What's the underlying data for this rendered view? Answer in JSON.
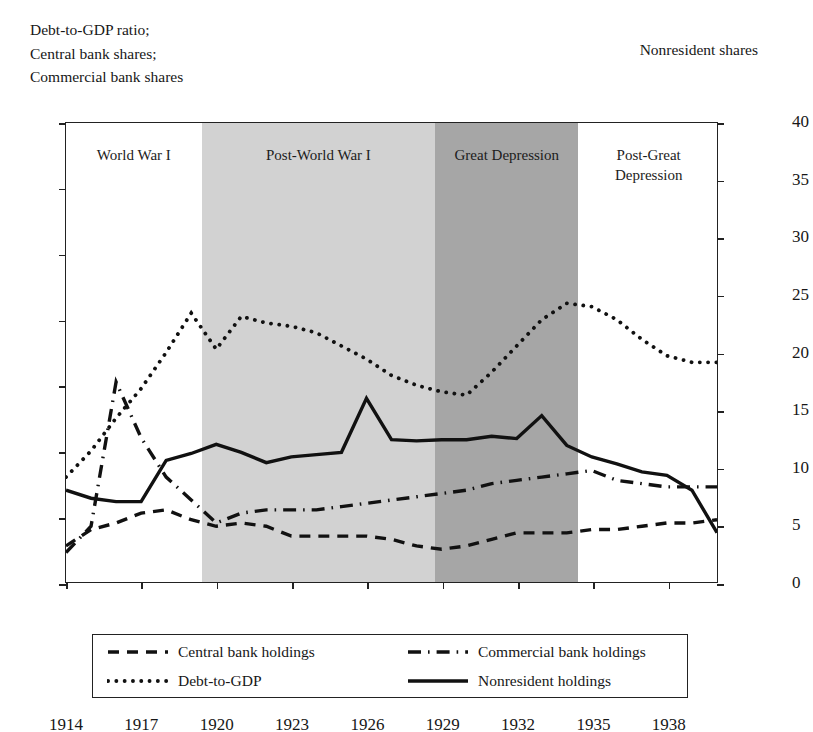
{
  "axis_caption_left": "Debt-to-GDP ratio;\nCentral bank shares;\nCommercial bank shares",
  "axis_caption_right": "Nonresident shares",
  "eras": [
    {
      "name": "world-war-i",
      "label": "World War I",
      "start": 1914,
      "end": 1919.4,
      "color": "#ffffff"
    },
    {
      "name": "post-world-war-i",
      "label": "Post-World War I",
      "start": 1919.4,
      "end": 1928.7,
      "color": "#d2d2d2"
    },
    {
      "name": "great-depression",
      "label": "Great Depression",
      "start": 1928.7,
      "end": 1934.4,
      "color": "#a6a6a6"
    },
    {
      "name": "post-great-depression",
      "label": "Post-Great\nDepression",
      "start": 1934.4,
      "end": 1940.0,
      "color": "#ffffff"
    }
  ],
  "legend": [
    {
      "label": "Central bank holdings",
      "style": "dashed"
    },
    {
      "label": "Commercial bank holdings",
      "style": "dashdot"
    },
    {
      "label": "Debt-to-GDP",
      "style": "dotted"
    },
    {
      "label": "Nonresident holdings",
      "style": "solid"
    }
  ],
  "chart_data": {
    "type": "line",
    "title": "",
    "xlabel": "",
    "ylabel": "Debt-to-GDP ratio; Central bank shares; Commercial bank shares",
    "ylabel_right": "Nonresident shares",
    "xlim": [
      1914,
      1940
    ],
    "ylim": [
      0,
      140
    ],
    "ylim_right": [
      0,
      40
    ],
    "yticks": [
      0,
      20,
      40,
      60,
      80,
      100,
      120,
      140
    ],
    "yticks_right": [
      0,
      5,
      10,
      15,
      20,
      25,
      30,
      35,
      40
    ],
    "xticks": [
      1914,
      1917,
      1920,
      1923,
      1926,
      1929,
      1932,
      1935,
      1938
    ],
    "grid": false,
    "legend_position": "below-axes",
    "x": [
      1914,
      1915,
      1916,
      1917,
      1918,
      1919,
      1920,
      1921,
      1922,
      1923,
      1924,
      1925,
      1926,
      1927,
      1928,
      1929,
      1930,
      1931,
      1932,
      1933,
      1934,
      1935,
      1936,
      1937,
      1938,
      1939,
      1940
    ],
    "series": [
      {
        "name": "Debt-to-GDP",
        "style": "dotted",
        "axis": "left",
        "values": [
          32,
          40,
          50,
          59,
          70,
          82,
          71,
          81,
          79,
          78,
          76,
          72,
          68,
          63,
          60,
          58,
          57,
          64,
          72,
          80,
          85,
          84,
          80,
          74,
          69,
          67,
          67
        ]
      },
      {
        "name": "Central bank holdings",
        "style": "dashed",
        "axis": "left",
        "values": [
          11,
          16,
          18,
          21,
          22,
          19,
          17,
          18,
          17,
          14,
          14,
          14,
          14,
          13,
          11,
          10,
          11,
          13,
          15,
          15,
          15,
          16,
          16,
          17,
          18,
          18,
          19
        ]
      },
      {
        "name": "Commercial bank holdings",
        "style": "dashdot",
        "axis": "left",
        "values": [
          9,
          17,
          61,
          44,
          32,
          25,
          18,
          21,
          22,
          22,
          22,
          23,
          24,
          25,
          26,
          27,
          28,
          30,
          31,
          32,
          33,
          34,
          31,
          30,
          29,
          29,
          29
        ]
      },
      {
        "name": "Nonresident holdings",
        "style": "solid",
        "axis": "right",
        "values": [
          8.0,
          7.3,
          7.0,
          7.0,
          10.6,
          11.2,
          12.0,
          11.3,
          10.4,
          10.9,
          11.1,
          11.3,
          16.0,
          12.4,
          12.3,
          12.4,
          12.4,
          12.7,
          12.5,
          14.5,
          11.9,
          10.9,
          10.3,
          9.6,
          9.3,
          8.0,
          4.3
        ]
      }
    ]
  }
}
